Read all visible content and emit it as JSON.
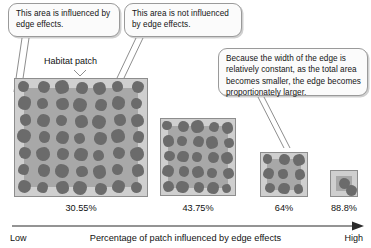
{
  "callouts": [
    {
      "id": "edge-influenced",
      "text": "This area is influenced by edge effects."
    },
    {
      "id": "edge-not-influenced",
      "text": "This area is not influenced by edge effects."
    },
    {
      "id": "edge-proportion",
      "text": "Because the width of the edge is relatively constant, as the total area becomes smaller, the edge becomes proportionately larger."
    }
  ],
  "habitat_label": "Habitat patch",
  "axis": {
    "low_label": "Low",
    "high_label": "High",
    "caption": "Percentage of patch influenced by edge effects"
  },
  "chart_data": {
    "type": "diagram",
    "title": "Percentage of patch influenced by edge effects",
    "xlabel": "Percentage of patch influenced by edge effects",
    "categories": [
      "Patch 1",
      "Patch 2",
      "Patch 3",
      "Patch 4"
    ],
    "values": [
      30.55,
      43.75,
      64,
      88.8
    ],
    "value_labels": [
      "30.55%",
      "43.75%",
      "64%",
      "88.8%"
    ],
    "grid": false,
    "legend": "none",
    "annotations": [
      "This area is influenced by edge effects.",
      "This area is not influenced by edge effects.",
      "Because the width of the edge is relatively constant, as the total area becomes smaller, the edge becomes proportionately larger.",
      "Habitat patch"
    ],
    "patches": [
      {
        "label": "30.55%",
        "grid_cols": 7,
        "grid_rows": 7,
        "blob_count": 49,
        "width_px": 134,
        "height_px": 119
      },
      {
        "label": "43.75%",
        "grid_cols": 5,
        "grid_rows": 5,
        "blob_count": 25,
        "width_px": 76,
        "height_px": 78
      },
      {
        "label": "64%",
        "grid_cols": 3,
        "grid_rows": 3,
        "blob_count": 9,
        "width_px": 48,
        "height_px": 45
      },
      {
        "label": "88.8%",
        "grid_cols": 1,
        "grid_rows": 2,
        "blob_count": 2,
        "width_px": 28,
        "height_px": 27
      }
    ]
  },
  "colors": {
    "edge_band": "#cfcfcf",
    "core_area": "#a8a8a8",
    "blob": "#6b6b6b",
    "patch_border": "#8d8d8d",
    "callout_border": "#9a9a9a",
    "callout_fill": "#fbfbfb",
    "axis_line": "#2b2b2b",
    "text": "#141414"
  }
}
